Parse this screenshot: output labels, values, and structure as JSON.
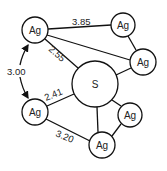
{
  "diagram": {
    "type": "molecular-structure",
    "central_atom": {
      "label": "S",
      "x": 95,
      "y": 84,
      "r": 23
    },
    "atoms": [
      {
        "id": "ag1",
        "label": "Ag",
        "x": 35,
        "y": 30,
        "r": 13
      },
      {
        "id": "ag2",
        "label": "Ag",
        "x": 123,
        "y": 25,
        "r": 12
      },
      {
        "id": "ag3",
        "label": "Ag",
        "x": 143,
        "y": 62,
        "r": 13
      },
      {
        "id": "ag4",
        "label": "Ag",
        "x": 35,
        "y": 112,
        "r": 13
      },
      {
        "id": "ag5",
        "label": "Ag",
        "x": 130,
        "y": 115,
        "r": 12
      },
      {
        "id": "ag6",
        "label": "Ag",
        "x": 102,
        "y": 145,
        "r": 13
      }
    ],
    "distances": {
      "ag1_ag2": "3.85",
      "ag1_s": "2.55",
      "ag1_ag4": "3.00",
      "ag4_s": "2.41",
      "ag4_ag6": "3.20"
    }
  }
}
